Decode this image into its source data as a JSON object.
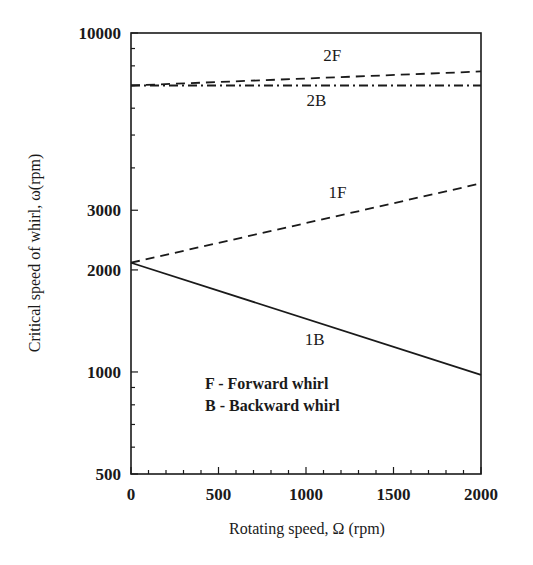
{
  "chart_data": {
    "type": "line",
    "title": "",
    "xlabel": "Rotating speed, Ω (rpm)",
    "ylabel": "Critical speed of whirl, ω(rpm)",
    "xlim": [
      0,
      2000
    ],
    "ylim": [
      500,
      10000
    ],
    "yscale": "log",
    "grid": false,
    "x_ticks": [
      0,
      500,
      1000,
      1500,
      2000
    ],
    "x_tick_labels": [
      "0",
      "500",
      "1000",
      "1500",
      "2000"
    ],
    "x_minor_step": 100,
    "y_ticks": [
      500,
      1000,
      2000,
      3000,
      10000
    ],
    "y_tick_labels": [
      "500",
      "1000",
      "2000",
      "3000",
      "10000"
    ],
    "y_minor_ticks": [
      600,
      700,
      800,
      900,
      4000,
      5000,
      6000,
      7000,
      8000,
      9000
    ],
    "x": [
      0,
      2000
    ],
    "series": [
      {
        "name": "2F",
        "values": [
          7000,
          7700
        ],
        "style": "dashed"
      },
      {
        "name": "2B",
        "values": [
          7000,
          7000
        ],
        "style": "dash-dot"
      },
      {
        "name": "1F",
        "values": [
          2100,
          3600
        ],
        "style": "dashed"
      },
      {
        "name": "1B",
        "values": [
          2100,
          980
        ],
        "style": "solid"
      }
    ],
    "annotations": [
      {
        "text": "2F",
        "x": 1150,
        "y": 8600
      },
      {
        "text": "2B",
        "x": 1060,
        "y": 6350
      },
      {
        "text": "1F",
        "x": 1180,
        "y": 3400
      },
      {
        "text": "1B",
        "x": 1050,
        "y": 1250
      }
    ],
    "legend": {
      "position": "inside-lower-left",
      "entries": [
        "F - Forward whirl",
        "B - Backward whirl"
      ]
    }
  }
}
